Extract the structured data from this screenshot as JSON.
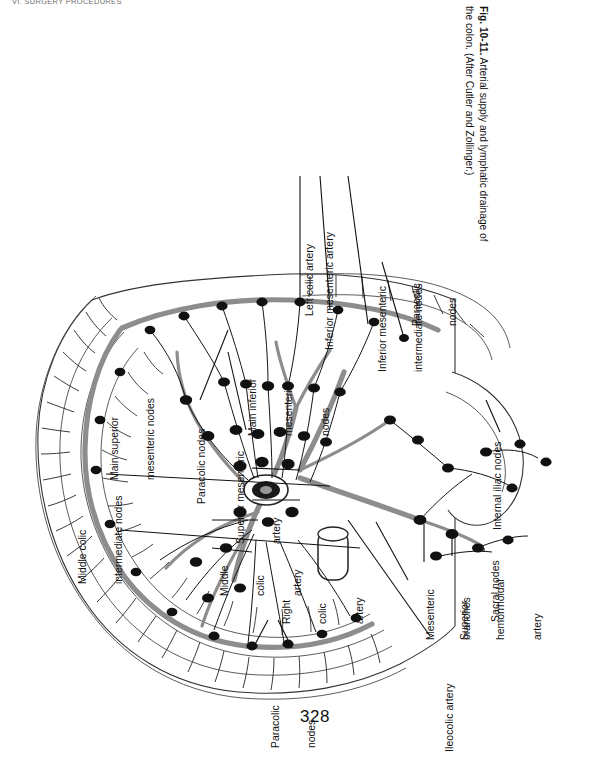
{
  "page": {
    "running_head": "VI. SURGERY PROCEDURES",
    "folio": "328",
    "background": "#ffffff",
    "ink": "#111111"
  },
  "caption": {
    "figure_number": "Fig. 10-11.",
    "text": "Arterial supply and lymphatic drainage of the colon. (After Cutler and Zollinger.)",
    "full": "Fig. 10-11. Arterial supply and lymphatic drainage of the colon. (After Cutler and Zollinger.)"
  },
  "figure": {
    "title": "Arterial supply and lymphatic drainage of the colon",
    "type": "anatomical-line-diagram",
    "source_credit": "After Cutler and Zollinger",
    "labels": [
      {
        "id": "left-colic-artery",
        "text": "Left colic artery"
      },
      {
        "id": "inferior-mesenteric-artery",
        "text": "Inferior mesenteric artery"
      },
      {
        "id": "inferior-mesenteric-intermediate-nodes",
        "line1": "Inferior mesenteric",
        "line2": "intermediate nodes"
      },
      {
        "id": "paracolic-nodes-right",
        "line1": "Paracolic",
        "line2": "nodes"
      },
      {
        "id": "main-inferior-mesenteric-nodes",
        "line1": "Main inferior",
        "line2": "mesenteric",
        "line3": "nodes"
      },
      {
        "id": "paracolic-nodes-mid",
        "text": "Paracolic nodes"
      },
      {
        "id": "superior-mesenteric-artery",
        "line1": "Superior mesenteric",
        "line2": "artery"
      },
      {
        "id": "main-superior-mesenteric-nodes",
        "line1": "Main superior",
        "line2": "mesenteric nodes"
      },
      {
        "id": "middle-colic-intermediate-nodes",
        "line1": "Middle colic",
        "line2": "intermediate nodes"
      },
      {
        "id": "middle-colic-artery",
        "line1": "Middle",
        "line2": "colic",
        "line3": "artery"
      },
      {
        "id": "right-colic-artery",
        "line1": "Right",
        "line2": "colic",
        "line3": "artery"
      },
      {
        "id": "paracolic-nodes-bottom",
        "line1": "Paracolic",
        "line2": "nodes"
      },
      {
        "id": "ileocolic-artery",
        "text": "Ileocolic artery"
      },
      {
        "id": "mesenteric-branches",
        "line1": "Mesenteric",
        "line2": "branches"
      },
      {
        "id": "superior-hemorrhoidal-artery",
        "line1": "Superior",
        "line2": "hemorrhoidal",
        "line3": "artery"
      },
      {
        "id": "sacral-nodes",
        "text": "Sacral nodes"
      },
      {
        "id": "internal-iliac-nodes",
        "text": "Internal iliac nodes"
      }
    ],
    "colors": {
      "artery": "#8d8d8d",
      "lymph_node": "#111111",
      "bowel_outline": "#333333",
      "leader_line": "#111111"
    }
  }
}
